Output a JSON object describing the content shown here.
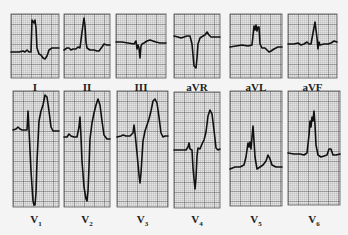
{
  "figure": {
    "colors": {
      "background": "#f4f4f4",
      "paper": "#e6e6e6",
      "minor_grid": "#a8a8a8",
      "major_grid": "#555555",
      "trace": "#111111"
    },
    "leads": [
      {
        "id": "I",
        "label": "I",
        "sub": "",
        "x": 11,
        "y": 14,
        "w": 48,
        "h": 64,
        "label_y": 81,
        "trace": "0,38 8,38 12,37 14,38 16,36 18,38 20,38 21,6 23,9 24,6 25,14 26,34 28,40 30,41 32,44 34,45 36,42 38,36 41,34 44,34 48,34"
      },
      {
        "id": "II",
        "label": "II",
        "sub": "",
        "x": 64,
        "y": 14,
        "w": 46,
        "h": 64,
        "label_y": 81,
        "trace": "0,36 3,34 5,34 7,36 9,35 12,35 14,33 16,34 18,18 20,4 21,12 22,28 23,34 26,36 30,36 33,37 35,37 38,33 40,30 43,31 46,31"
      },
      {
        "id": "III",
        "label": "III",
        "sub": "",
        "x": 116,
        "y": 14,
        "w": 50,
        "h": 64,
        "label_y": 81,
        "trace": "0,28 6,28 12,29 18,30 20,27 21,35 22,31 23,34 24,44 25,32 26,30 28,29 31,27 34,26 37,27 40,28 44,29 50,29"
      },
      {
        "id": "aVR",
        "label": "aVR",
        "sub": "",
        "x": 174,
        "y": 14,
        "w": 46,
        "h": 64,
        "label_y": 81,
        "trace": "0,22 4,23 7,24 10,23 13,22 16,22 18,30 20,52 22,54 23,44 24,30 26,24 29,22 31,21 33,18 35,21 37,23 40,23 46,23"
      },
      {
        "id": "aVL",
        "label": "aVL",
        "sub": "",
        "x": 230,
        "y": 14,
        "w": 52,
        "h": 64,
        "label_y": 81,
        "trace": "0,33 6,32 12,31 18,32 22,31 24,12 25,16 26,11 27,17 28,13 29,13 30,30 32,34 35,34 37,36 39,38 41,37 44,35 48,33 52,33"
      },
      {
        "id": "aVF",
        "label": "aVF",
        "sub": "",
        "x": 288,
        "y": 14,
        "w": 49,
        "h": 64,
        "label_y": 81,
        "trace": "0,30 6,30 10,29 13,31 16,30 19,28 21,30 23,30 25,19 27,8 28,16 29,24 30,35 31,28 32,31 36,30 40,30 43,29 46,27 49,28"
      },
      {
        "id": "V1",
        "label": "V",
        "sub": "1",
        "x": 13,
        "y": 91,
        "w": 46,
        "h": 116,
        "label_y": 213,
        "trace": "0,39 3,38 5,36 7,38 9,39 11,39 14,39 15,20 16,38 18,80 20,110 21,114 22,114 23,102 24,70 26,30 28,20 30,14 32,4 34,6 36,20 38,36 40,40 44,40 46,40"
      },
      {
        "id": "V2",
        "label": "V",
        "sub": "2",
        "x": 64,
        "y": 91,
        "w": 46,
        "h": 116,
        "label_y": 213,
        "trace": "0,46 3,46 5,43 7,45 10,46 13,46 15,36 16,26 17,46 18,70 20,96 22,108 23,110 24,100 25,76 26,48 28,32 30,22 32,14 34,8 36,14 38,30 40,44 43,48 46,48"
      },
      {
        "id": "V3",
        "label": "V",
        "sub": "3",
        "x": 117,
        "y": 91,
        "w": 51,
        "h": 116,
        "label_y": 213,
        "trace": "0,46 4,45 6,44 9,45 13,45 16,42 17,34 18,42 20,62 22,84 23,92 24,82 26,50 28,40 30,34 32,28 34,20 36,10 38,8 40,12 42,26 44,42 46,46 48,45 51,45"
      },
      {
        "id": "V4",
        "label": "V",
        "sub": "4",
        "x": 174,
        "y": 92,
        "w": 46,
        "h": 116,
        "label_y": 213,
        "trace": "0,58 4,58 8,58 12,58 14,55 15,51 16,57 18,58 19,76 21,97 22,86 23,64 24,56 26,57 28,52 30,48 32,40 34,24 36,18 38,22 40,38 42,56 44,58 46,57"
      },
      {
        "id": "V5",
        "label": "V",
        "sub": "5",
        "x": 230,
        "y": 91,
        "w": 52,
        "h": 115,
        "label_y": 213,
        "trace": "0,78 5,76 10,76 14,74 16,66 18,52 19,56 20,51 21,58 22,46 23,35 24,50 25,66 27,78 30,76 33,74 36,70 38,64 40,68 42,74 46,76 52,76"
      },
      {
        "id": "V6",
        "label": "V",
        "sub": "6",
        "x": 288,
        "y": 91,
        "w": 52,
        "h": 114,
        "label_y": 213,
        "trace": "0,62 6,63 12,63 16,64 19,62 21,44 22,30 23,36 24,26 25,30 26,20 27,34 28,54 30,64 33,66 36,65 39,64 41,58 43,58 45,64 48,64 52,63"
      }
    ]
  }
}
